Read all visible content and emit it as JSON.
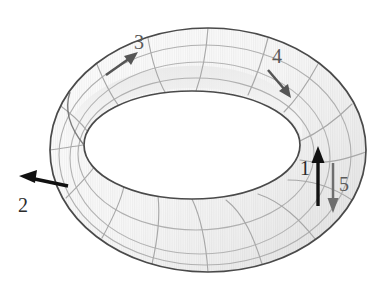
{
  "figure": {
    "name": "torus-diagram",
    "shape": "torus",
    "background_color": "#ffffff",
    "surface_fill_light": "#f2f2f2",
    "surface_fill_mid": "#e3e3e3",
    "surface_fill_dark": "#c9c9c9",
    "outline_color": "#4a4a4a",
    "gridline_color": "#a8a8a8",
    "view": "three-quarter perspective, hole facing up-front"
  },
  "geometry": {
    "outer_center_x": 208,
    "outer_center_y": 150,
    "outer_rx": 158,
    "outer_ry": 122,
    "hole_center_x": 192,
    "hole_center_y": 145,
    "hole_rx": 108,
    "hole_ry": 54,
    "radial_segments": 16,
    "circumferential_bands": 3
  },
  "arrows": [
    {
      "id": "arrow-1",
      "label": "1",
      "color": "#111111",
      "direction": "up",
      "shaft_x1": 318,
      "shaft_y1": 205,
      "shaft_x2": 318,
      "shaft_y2": 152,
      "label_x": 302,
      "label_y": 168,
      "stroke_width": 3.2,
      "head_size": 9
    },
    {
      "id": "arrow-2",
      "label": "2",
      "color": "#111111",
      "direction": "left",
      "shaft_x1": 67,
      "shaft_y1": 185,
      "shaft_x2": 24,
      "shaft_y2": 177,
      "label_x": 19,
      "label_y": 198,
      "stroke_width": 3.2,
      "head_size": 9
    },
    {
      "id": "arrow-3",
      "label": "3",
      "color": "#555555",
      "direction": "up-right",
      "shaft_x1": 108,
      "shaft_y1": 73,
      "shaft_x2": 135,
      "shaft_y2": 54,
      "label_x": 135,
      "label_y": 34,
      "stroke_width": 2.4,
      "head_size": 7
    },
    {
      "id": "arrow-4",
      "label": "4",
      "color": "#555555",
      "direction": "down-right",
      "shaft_x1": 269,
      "shaft_y1": 71,
      "shaft_x2": 288,
      "shaft_y2": 93,
      "label_x": 272,
      "label_y": 48,
      "stroke_width": 2.4,
      "head_size": 7
    },
    {
      "id": "arrow-5",
      "label": "5",
      "color": "#6e6e6e",
      "direction": "down",
      "shaft_x1": 333,
      "shaft_y1": 165,
      "shaft_x2": 333,
      "shaft_y2": 212,
      "label_x": 339,
      "label_y": 177,
      "stroke_width": 2.4,
      "head_size": 7
    }
  ],
  "labels": {
    "one": "1",
    "two": "2",
    "three": "3",
    "four": "4",
    "five": "5"
  }
}
